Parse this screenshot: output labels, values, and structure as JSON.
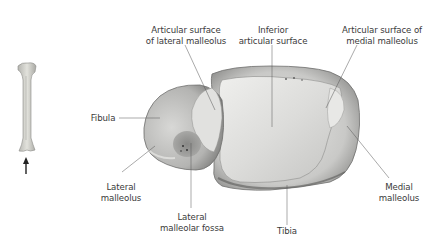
{
  "figure": {
    "labels": {
      "articular_lateral": [
        "Articular surface",
        "of lateral malleolus"
      ],
      "inferior_articular": [
        "Inferior",
        "articular surface"
      ],
      "articular_medial": [
        "Articular surface of",
        "medial malleolus"
      ],
      "fibula": [
        "Fibula"
      ],
      "lateral_malleolus": [
        "Lateral",
        "malleolus"
      ],
      "lateral_malleolar_fossa": [
        "Lateral",
        "malleolar fossa"
      ],
      "tibia": [
        "Tibia"
      ],
      "medial_malleolus": [
        "Medial",
        "malleolus"
      ]
    },
    "inset": {
      "description": "Orientation inset: whole tibia with arrow indicating viewing direction",
      "arrow_direction": "up"
    },
    "colors": {
      "bone_light": "#e4e4e2",
      "bone_mid": "#b9b9b7",
      "bone_dark": "#6f6f6d",
      "leader_line": "#555555",
      "text": "#3a3a3a"
    }
  }
}
